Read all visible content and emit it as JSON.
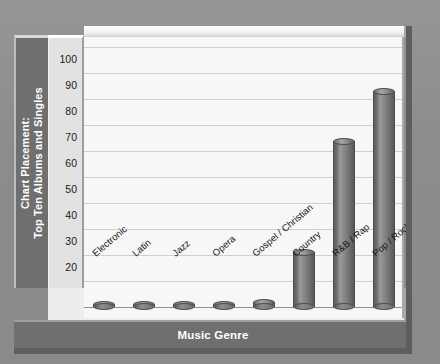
{
  "chart_data": {
    "type": "bar",
    "title": "",
    "categories": [
      "Electronic",
      "Latin",
      "Jazz",
      "Opera",
      "Gospel / Christian",
      "Country",
      "R&B / Rap",
      "Pop / Rock"
    ],
    "values": [
      0.5,
      0.5,
      0.5,
      0.5,
      2,
      21,
      64,
      83
    ],
    "xlabel": "Music Genre",
    "ylabel": "Chart Placement: Top Ten Albums and Singles",
    "ylabel_line1": "Chart Placement:",
    "ylabel_line2": "Top Ten Albums and Singles",
    "ylim": [
      0,
      100
    ],
    "yticks": [
      0,
      10,
      20,
      30,
      40,
      50,
      60,
      70,
      80,
      90,
      100
    ],
    "ytick_labels": [
      "0",
      "10",
      "20",
      "30",
      "40",
      "50",
      "60",
      "70",
      "80",
      "90",
      "100"
    ],
    "grid": true,
    "legend": "none",
    "bar_style": "cylinder-3d",
    "colors": {
      "bar": "#7a7a7a",
      "bar_edge": "#4d4d4d",
      "plot_background": "#f7f7f7",
      "gridline": "#cfcfcf",
      "axis_band": "#6f6f6f",
      "axis_band_text": "#ffffff",
      "page_background": "#8f8f8f",
      "tick_panel": "#e2e2e2"
    }
  }
}
